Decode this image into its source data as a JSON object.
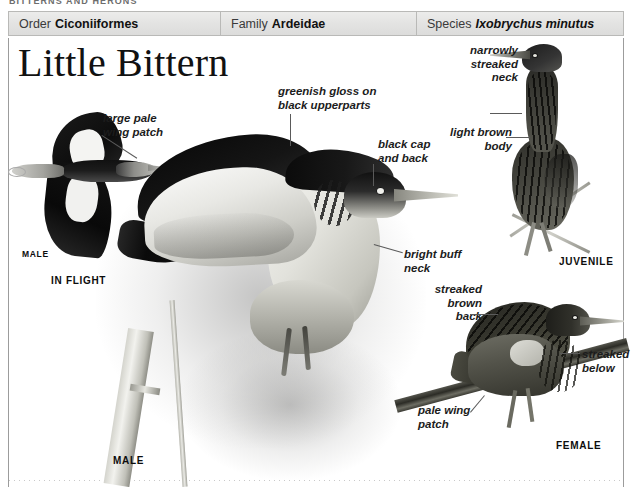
{
  "page": {
    "running_head": "BITTERNS AND HERONS",
    "species_title": "Little Bittern"
  },
  "taxonomy": {
    "order": {
      "key": "Order",
      "value": "Ciconiiformes"
    },
    "family": {
      "key": "Family",
      "value": "Ardeidae"
    },
    "species": {
      "key": "Species",
      "value": "Ixobrychus minutus"
    }
  },
  "plates": {
    "in_flight": {
      "sex_label": "MALE",
      "plate_label": "IN FLIGHT"
    },
    "perched_male": {
      "plate_label": "MALE"
    },
    "juvenile": {
      "plate_label": "JUVENILE"
    },
    "female": {
      "plate_label": "FEMALE"
    }
  },
  "callouts": {
    "wing_patch_flight": "large pale\nwing patch",
    "greenish_gloss": "greenish gloss on\nblack upperparts",
    "black_cap": "black cap\nand back",
    "buff_neck": "bright buff\nneck",
    "narrow_streaked_neck": "narrowly\nstreaked\nneck",
    "light_brown_body": "light brown\nbody",
    "streaked_brown_back": "streaked\nbrown\nback",
    "streaked_below": "streaked\nbelow",
    "pale_wing_patch": "pale wing\npatch"
  },
  "colors": {
    "header_bg": "#e4e4e3",
    "header_border": "#b9b9b7",
    "rule": "#9c9c9c",
    "text": "#1c1c1c",
    "page_bg": "#ffffff"
  }
}
